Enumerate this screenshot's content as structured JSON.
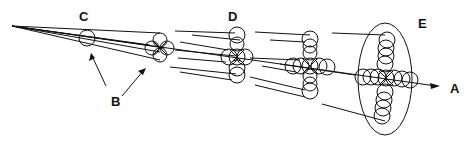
{
  "diagram": {
    "type": "beam-projection",
    "labels": {
      "a": "A",
      "b": "B",
      "c": "C",
      "d": "D",
      "e": "E"
    },
    "colors": {
      "stroke": "#111111",
      "background": "#ffffff"
    }
  }
}
